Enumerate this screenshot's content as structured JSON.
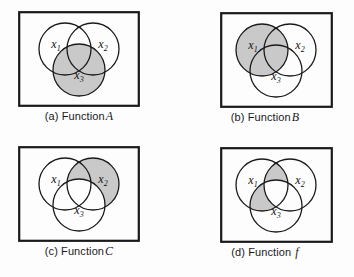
{
  "figure": {
    "background_color": "#fdfdfd",
    "line_color": "#1a1a1a",
    "shade_color": "#c9c9c9",
    "frame_stroke_px": 2.2,
    "circle_stroke_px": 1.3
  },
  "panels": [
    {
      "id": "a",
      "caption_prefix": "(a) Function",
      "caption_name": "A",
      "labels": {
        "c1": "x",
        "c1sub": "1",
        "c2": "x",
        "c2sub": "2",
        "c3": "x",
        "c3sub": "3"
      },
      "shaded_description": "entire x3 circle including all intersections",
      "shaded_sets": [
        "x3"
      ]
    },
    {
      "id": "b",
      "caption_prefix": "(b) Function",
      "caption_name": "B",
      "labels": {
        "c1": "x",
        "c1sub": "1",
        "c2": "x",
        "c2sub": "2",
        "c3": "x",
        "c3sub": "3"
      },
      "shaded_description": "entire x1 circle including all intersections",
      "shaded_sets": [
        "x1"
      ]
    },
    {
      "id": "c",
      "caption_prefix": "(c) Function",
      "caption_name": "C",
      "labels": {
        "c1": "x",
        "c1sub": "1",
        "c2": "x",
        "c2sub": "2",
        "c3": "x",
        "c3sub": "3"
      },
      "shaded_description": "x2 circle minus the part overlapping x3",
      "shaded_sets": [
        "x2 minus x3"
      ]
    },
    {
      "id": "d",
      "caption_prefix": "(d) Function",
      "caption_name": "f",
      "labels": {
        "c1": "x",
        "c1sub": "1",
        "c2": "x",
        "c2sub": "2",
        "c3": "x",
        "c3sub": "3"
      },
      "shaded_description": "x1 intersect x2 lens and x1 intersect x3 lens, excluding the triple intersection",
      "shaded_sets": [
        "(x1 and x2) or (x1 and x3) minus (x1 and x2 and x3)"
      ]
    }
  ]
}
